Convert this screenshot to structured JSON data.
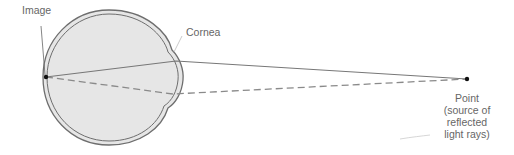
{
  "labels": {
    "image": "Image",
    "cornea": "Cornea",
    "point_lines": [
      "Point",
      "(source of",
      "reflected",
      "light rays)"
    ]
  },
  "colors": {
    "eye_fill": "#e6e6e6",
    "eye_outline": "#6e6e6e",
    "ray_solid": "#777777",
    "ray_dashed": "#8a8a8a",
    "label_text": "#666666",
    "dot": "#111111"
  }
}
